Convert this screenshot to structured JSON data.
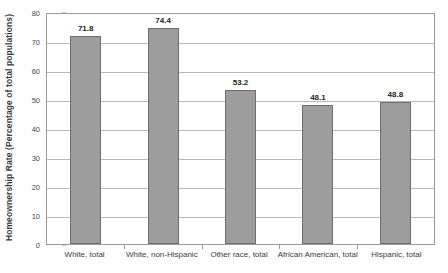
{
  "chart_data": {
    "type": "bar",
    "title": "",
    "subtitle": "",
    "xlabel": "",
    "ylabel": "Homeownership Rate (Percentage of total populations)",
    "categories": [
      "White, total",
      "White, non-Hispanic",
      "Other race, total",
      "African American, total",
      "Hispanic, total"
    ],
    "values": [
      71.8,
      74.4,
      53.2,
      48.1,
      48.8
    ],
    "value_labels": [
      "71.8",
      "74.4",
      "53.2",
      "48.1",
      "48.8"
    ],
    "ylim": [
      0,
      80
    ],
    "ytick_values": [
      0,
      10,
      20,
      30,
      40,
      50,
      60,
      70,
      80
    ],
    "ytick_labels": [
      "0",
      "10",
      "20",
      "30",
      "40",
      "50",
      "60",
      "70",
      "80"
    ],
    "grid": "horizontal",
    "legend": "none",
    "bar_color": "#9d9d9d",
    "bar_edge_color": "#6e6e6e",
    "gridline_color": "#b9b9b9",
    "frame_color": "#9a9a9a",
    "background_color": "#ffffff"
  }
}
